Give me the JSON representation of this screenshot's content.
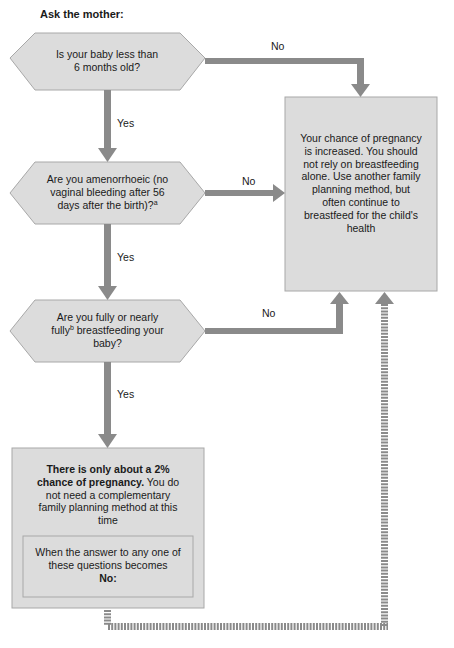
{
  "header": {
    "title": "Ask the mother:"
  },
  "questions": [
    {
      "text": "Is your baby less than 6 months old?"
    },
    {
      "text_pre": "Are you amenorrhoeic (no vaginal bleeding after 56 days after the birth)?",
      "sup": "a"
    },
    {
      "text_pre": "Are you fully or nearly fully",
      "sup": "b",
      "text_post": " breastfeeding your baby?"
    }
  ],
  "edges": {
    "no_label": "No",
    "yes_label": "Yes"
  },
  "outcome_increased": {
    "text": "Your chance of pregnancy is increased. You should not rely on breastfeeding alone. Use another family planning method, but often continue to breastfeed for the child's health"
  },
  "outcome_low": {
    "bold": "There is only about a 2% chance of pregnancy.",
    "text": " You do not need a complementary family planning method at this time",
    "note_text": "When the answer to any one of these questions becomes",
    "note_bold": "No:"
  },
  "colors": {
    "arrow": "#8a8a8a",
    "box_fill": "#dcdcdc",
    "box_border": "#a8a8a8"
  }
}
